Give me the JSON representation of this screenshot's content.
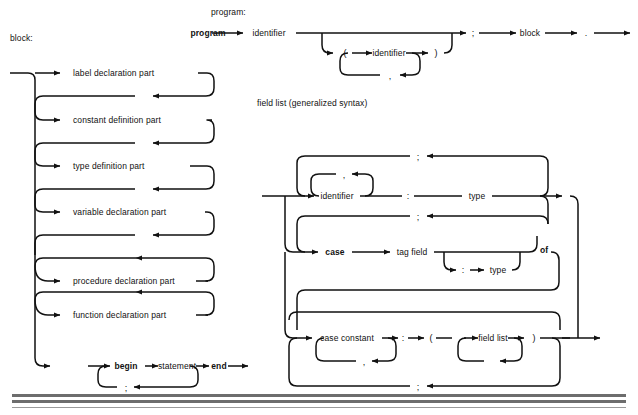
{
  "page": {
    "width": 638,
    "height": 415,
    "background": "#ffffff",
    "ink": "#111111",
    "rule_color": "#6d6d6d",
    "kind": "syntax-railroad-diagram-page"
  },
  "headings": {
    "block": "block:",
    "program": "program:",
    "field_list": "field list (generalized syntax)"
  },
  "block_diagram": {
    "title": "block:",
    "optional_parts": [
      "label declaration part",
      "constant definition part",
      "type definition part",
      "variable declaration part"
    ],
    "repeatable_parts": [
      "procedure declaration part",
      "function declaration part"
    ],
    "compound_statement": {
      "begin": "begin",
      "statement": "statement",
      "end": "end",
      "separator": ";"
    }
  },
  "program_diagram": {
    "title": "program:",
    "keyword": "program",
    "identifier": "identifier",
    "param_identifier": "identifier",
    "open_paren": "(",
    "close_paren": ")",
    "comma": ",",
    "semicolon": ";",
    "block": "block",
    "period": "."
  },
  "field_list_diagram": {
    "title": "field list (generalized syntax)",
    "identifier": "identifier",
    "colon": ":",
    "type": "type",
    "comma": ",",
    "semicolon": ";",
    "case": "case",
    "tag_field": "tag field",
    "tag_colon": ":",
    "tag_type": "type",
    "of": "of",
    "case_constant": "case constant",
    "case_colon": ":",
    "open_paren": "(",
    "field_list": "field list",
    "close_paren": ")"
  },
  "footer_rules": [
    {
      "y": 394,
      "height": 3
    },
    {
      "y": 400,
      "height": 3
    },
    {
      "y": 407,
      "height": 1
    }
  ]
}
